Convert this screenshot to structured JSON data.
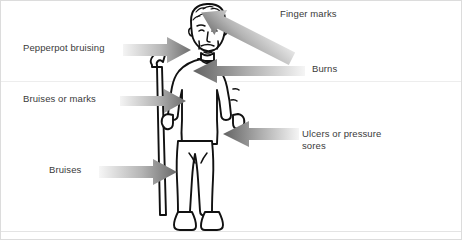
{
  "diagram": {
    "canvas": {
      "width": 462,
      "height": 240,
      "background": "#ffffff"
    },
    "colors": {
      "text": "#3a3a3a",
      "arrow_dark": "#6b6b6b",
      "arrow_light": "#f2f2f2",
      "outline": "#1a1a1a",
      "rule": "#ededed",
      "border": "#dcdcdc"
    },
    "labels": [
      {
        "id": "pepperpot-bruising",
        "text": "Pepperpot bruising",
        "side": "left",
        "arrow": "arrow-right",
        "target": "upper-chest"
      },
      {
        "id": "bruises-or-marks",
        "text": "Bruises or marks",
        "side": "left",
        "arrow": "arrow-right",
        "target": "left-forearm"
      },
      {
        "id": "bruises",
        "text": "Bruises",
        "side": "left",
        "arrow": "arrow-right",
        "target": "left-leg"
      },
      {
        "id": "finger-marks",
        "text": "Finger marks",
        "side": "right",
        "arrow": "arrow-down-left",
        "target": "shoulder-neck"
      },
      {
        "id": "burns",
        "text": "Burns",
        "side": "right",
        "arrow": "arrow-left",
        "target": "chest"
      },
      {
        "id": "ulcers-or-pressure-sores",
        "text": "Ulcers or pressure\nsores",
        "side": "right",
        "arrow": "arrow-left",
        "target": "right-hand-hip"
      }
    ]
  }
}
